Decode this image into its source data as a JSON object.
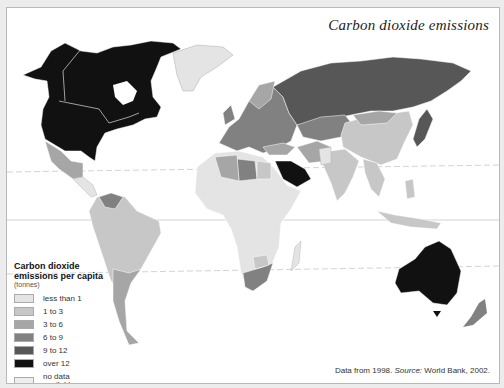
{
  "title": "Carbon dioxide emissions",
  "legend": {
    "title_line1": "Carbon dioxide",
    "title_line2": "emissions per capita",
    "unit": "(tonnes)",
    "items": [
      {
        "label": "less than 1",
        "color": "#e4e4e4"
      },
      {
        "label": "1 to 3",
        "color": "#c7c7c7"
      },
      {
        "label": "3 to 6",
        "color": "#a6a6a6"
      },
      {
        "label": "6 to 9",
        "color": "#818181"
      },
      {
        "label": "9 to 12",
        "color": "#575757"
      },
      {
        "label": "over 12",
        "color": "#111111"
      },
      {
        "label": "no data available",
        "label_line1": "no data",
        "label_line2": "available",
        "color": "#efefef"
      }
    ]
  },
  "source": {
    "prefix": "Data from 1998.",
    "source_label": "Source:",
    "source_text": "World Bank, 2002."
  },
  "regions": [
    {
      "name": "North America (USA, Canada)",
      "category": "over 12"
    },
    {
      "name": "Greenland",
      "category": "less than 1"
    },
    {
      "name": "Mexico",
      "category": "3 to 6"
    },
    {
      "name": "Central America",
      "category": "less than 1"
    },
    {
      "name": "Venezuela",
      "category": "6 to 9"
    },
    {
      "name": "Brazil / South America",
      "category": "1 to 3"
    },
    {
      "name": "Argentina",
      "category": "3 to 6"
    },
    {
      "name": "Western Europe",
      "category": "6 to 9"
    },
    {
      "name": "Russia",
      "category": "9 to 12"
    },
    {
      "name": "Kazakhstan / Central Asia",
      "category": "6 to 9"
    },
    {
      "name": "China",
      "category": "1 to 3"
    },
    {
      "name": "India",
      "category": "1 to 3"
    },
    {
      "name": "Saudi Arabia",
      "category": "over 12"
    },
    {
      "name": "Iran",
      "category": "3 to 6"
    },
    {
      "name": "Japan",
      "category": "9 to 12"
    },
    {
      "name": "Africa",
      "category": "less than 1"
    },
    {
      "name": "Libya",
      "category": "6 to 9"
    },
    {
      "name": "South Africa",
      "category": "6 to 9"
    },
    {
      "name": "Australia",
      "category": "over 12"
    },
    {
      "name": "New Zealand",
      "category": "6 to 9"
    },
    {
      "name": "Southeast Asia",
      "category": "1 to 3"
    }
  ]
}
